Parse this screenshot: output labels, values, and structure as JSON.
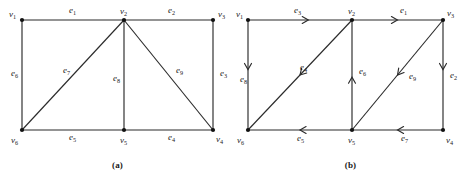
{
  "figures": [
    {
      "id": "a",
      "caption": "(a)",
      "directed": false,
      "vertices": [
        {
          "name": "v1",
          "label": "v",
          "sub": "1",
          "x": 22,
          "y": 20,
          "label_dx": -13,
          "label_dy": -3
        },
        {
          "name": "v2",
          "label": "v",
          "sub": "2",
          "x": 124,
          "y": 20,
          "label_dx": -4,
          "label_dy": -6
        },
        {
          "name": "v3",
          "label": "v",
          "sub": "3",
          "x": 213,
          "y": 20,
          "label_dx": 5,
          "label_dy": -3
        },
        {
          "name": "v4",
          "label": "v",
          "sub": "4",
          "x": 213,
          "y": 130,
          "label_dx": 3,
          "label_dy": 12
        },
        {
          "name": "v5",
          "label": "v",
          "sub": "5",
          "x": 124,
          "y": 130,
          "label_dx": -4,
          "label_dy": 13
        },
        {
          "name": "v6",
          "label": "v",
          "sub": "6",
          "x": 22,
          "y": 130,
          "label_dx": -11,
          "label_dy": 13
        }
      ],
      "edges": [
        {
          "name": "e1",
          "label": "e",
          "sub": "1",
          "from": "v1",
          "to": "v2",
          "lx": 69,
          "ly": 13
        },
        {
          "name": "e2",
          "label": "e",
          "sub": "2",
          "from": "v2",
          "to": "v3",
          "lx": 168,
          "ly": 13
        },
        {
          "name": "e3",
          "label": "e",
          "sub": "3",
          "from": "v3",
          "to": "v4",
          "lx": 220,
          "ly": 76
        },
        {
          "name": "e4",
          "label": "e",
          "sub": "4",
          "from": "v5",
          "to": "v4",
          "lx": 168,
          "ly": 140
        },
        {
          "name": "e5",
          "label": "e",
          "sub": "5",
          "from": "v6",
          "to": "v5",
          "lx": 69,
          "ly": 140
        },
        {
          "name": "e6",
          "label": "e",
          "sub": "6",
          "from": "v1",
          "to": "v6",
          "lx": 11,
          "ly": 76
        },
        {
          "name": "e7",
          "label": "e",
          "sub": "7",
          "from": "v2",
          "to": "v6",
          "lx": 63,
          "ly": 73
        },
        {
          "name": "e8",
          "label": "e",
          "sub": "8",
          "from": "v2",
          "to": "v5",
          "lx": 113,
          "ly": 81
        },
        {
          "name": "e9",
          "label": "e",
          "sub": "9",
          "from": "v2",
          "to": "v4",
          "lx": 176,
          "ly": 73
        }
      ]
    },
    {
      "id": "b",
      "caption": "(b)",
      "directed": true,
      "vertices": [
        {
          "name": "v1",
          "label": "v",
          "sub": "1",
          "x": 18,
          "y": 20,
          "label_dx": -12,
          "label_dy": -3
        },
        {
          "name": "v2",
          "label": "v",
          "sub": "2",
          "x": 122,
          "y": 20,
          "label_dx": -4,
          "label_dy": -6
        },
        {
          "name": "v3",
          "label": "v",
          "sub": "3",
          "x": 213,
          "y": 20,
          "label_dx": 4,
          "label_dy": -4
        },
        {
          "name": "v4",
          "label": "v",
          "sub": "4",
          "x": 213,
          "y": 130,
          "label_dx": 3,
          "label_dy": 13
        },
        {
          "name": "v5",
          "label": "v",
          "sub": "5",
          "x": 122,
          "y": 130,
          "label_dx": -4,
          "label_dy": 13
        },
        {
          "name": "v6",
          "label": "v",
          "sub": "6",
          "x": 18,
          "y": 130,
          "label_dx": -11,
          "label_dy": 13
        }
      ],
      "edges": [
        {
          "name": "e3",
          "label": "e",
          "sub": "3",
          "from": "v1",
          "to": "v2",
          "lx": 64,
          "ly": 13,
          "arrow_t": 0.58,
          "dir": "right"
        },
        {
          "name": "e1",
          "label": "e",
          "sub": "1",
          "from": "v2",
          "to": "v3",
          "lx": 170,
          "ly": 13,
          "arrow_t": 0.5,
          "dir": "right"
        },
        {
          "name": "e8",
          "label": "e",
          "sub": "8",
          "from": "v1",
          "to": "v6",
          "lx": 10,
          "ly": 82,
          "arrow_t": 0.45,
          "dir": "down"
        },
        {
          "name": "e2",
          "label": "e",
          "sub": "2",
          "from": "v3",
          "to": "v4",
          "lx": 220,
          "ly": 78,
          "arrow_t": 0.45,
          "dir": "down"
        },
        {
          "name": "e6",
          "label": "e",
          "sub": "6",
          "from": "v5",
          "to": "v2",
          "lx": 129,
          "ly": 74,
          "arrow_t": 0.48,
          "dir": "up"
        },
        {
          "name": "e4",
          "label": "e",
          "sub": "4",
          "from": "v2",
          "to": "v6",
          "lx": 70,
          "ly": 70,
          "arrow_t": 0.5,
          "dir": "diag-dl"
        },
        {
          "name": "e9",
          "label": "e",
          "sub": "9",
          "from": "v3",
          "to": "v5",
          "lx": 179,
          "ly": 79,
          "arrow_t": 0.5,
          "dir": "diag-dl"
        },
        {
          "name": "e5",
          "label": "e",
          "sub": "5",
          "from": "v6",
          "to": "v5",
          "lx": 67,
          "ly": 141,
          "arrow_t": 0.5,
          "dir": "left"
        },
        {
          "name": "e7",
          "label": "e",
          "sub": "7",
          "from": "v5",
          "to": "v4",
          "lx": 171,
          "ly": 141,
          "arrow_t": 0.5,
          "dir": "left"
        }
      ]
    }
  ]
}
